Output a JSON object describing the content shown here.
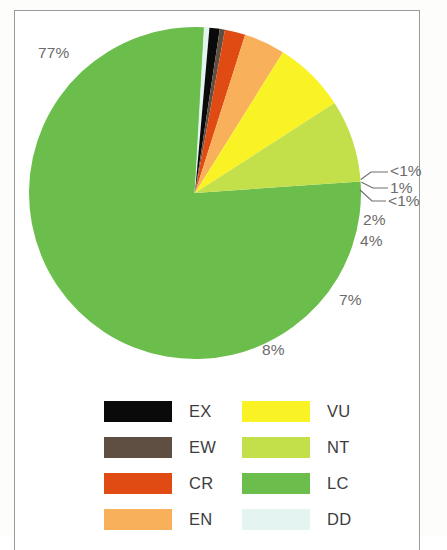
{
  "chart_data": {
    "type": "pie",
    "title": "",
    "subtitle": "",
    "xlabel": "",
    "ylabel": "",
    "grid": false,
    "legend_position": "bottom",
    "start_angle_deg": -4,
    "direction": "clockwise",
    "categories": [
      "LC",
      "DD",
      "EX",
      "EW",
      "CR",
      "EN",
      "VU",
      "NT"
    ],
    "values": [
      77,
      0.5,
      1,
      0.5,
      2,
      4,
      7,
      8
    ],
    "data_labels": [
      "77%",
      "<1%",
      "1%",
      "<1%",
      "2%",
      "4%",
      "7%",
      "8%"
    ],
    "colors": [
      "#6cbe4c",
      "#e4f4f1",
      "#0a0a0a",
      "#5e4f42",
      "#e04a13",
      "#f8b05a",
      "#f9f326",
      "#c3e04a"
    ],
    "slices": [
      {
        "label": "LC",
        "value": 77,
        "display": "77%",
        "color": "#6cbe4c"
      },
      {
        "label": "DD",
        "value": 0.5,
        "display": "<1%",
        "color": "#e4f4f1"
      },
      {
        "label": "EX",
        "value": 1,
        "display": "1%",
        "color": "#0a0a0a"
      },
      {
        "label": "EW",
        "value": 0.5,
        "display": "<1%",
        "color": "#5e4f42"
      },
      {
        "label": "CR",
        "value": 2,
        "display": "2%",
        "color": "#e04a13"
      },
      {
        "label": "EN",
        "value": 4,
        "display": "4%",
        "color": "#f8b05a"
      },
      {
        "label": "VU",
        "value": 7,
        "display": "7%",
        "color": "#f9f326"
      },
      {
        "label": "NT",
        "value": 8,
        "display": "8%",
        "color": "#c3e04a"
      }
    ]
  },
  "labels": {
    "lc": "77%",
    "dd": "<1%",
    "ex": "1%",
    "ew": "<1%",
    "cr": "2%",
    "en": "4%",
    "vu": "7%",
    "nt": "8%"
  },
  "legend": {
    "left_column": [
      {
        "label": "EX",
        "color": "#0a0a0a"
      },
      {
        "label": "EW",
        "color": "#5e4f42"
      },
      {
        "label": "CR",
        "color": "#e04a13"
      },
      {
        "label": "EN",
        "color": "#f8b05a"
      }
    ],
    "right_column": [
      {
        "label": "VU",
        "color": "#f9f326"
      },
      {
        "label": "NT",
        "color": "#c3e04a"
      },
      {
        "label": "LC",
        "color": "#6cbe4c"
      },
      {
        "label": "DD",
        "color": "#e4f4f1"
      }
    ]
  }
}
